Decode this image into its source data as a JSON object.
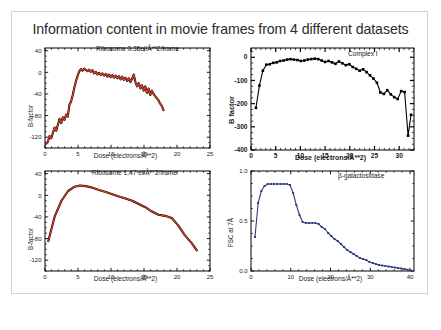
{
  "figure": {
    "title": "Information content in movie frames from 4 different datasets",
    "background": "#ffffff",
    "border_color": "#d3d3d3"
  },
  "chart_data": [
    {
      "id": "ribosome-low-dose",
      "type": "line",
      "title": "Ribosome 0.35el/Å**2/frame",
      "xlabel": "Dose (electrons/Å**2)",
      "ylabel": "B-factor",
      "xlim": [
        0,
        25
      ],
      "ylim": [
        -140,
        45
      ],
      "xticks": [
        0,
        5,
        10,
        15,
        20,
        25
      ],
      "yticks": [
        40,
        0,
        -40,
        -80,
        -120
      ],
      "grid": false,
      "legend": "none",
      "line_color": "#e8401f",
      "underlay_color": "#000000",
      "marker": "none",
      "x": [
        0.2,
        0.45,
        0.7,
        0.95,
        1.2,
        1.45,
        1.7,
        1.95,
        2.2,
        2.45,
        2.7,
        2.95,
        3.2,
        3.45,
        3.7,
        3.95,
        4.2,
        4.45,
        4.7,
        4.95,
        5.2,
        5.45,
        5.7,
        5.95,
        6.2,
        6.45,
        6.7,
        6.95,
        7.2,
        7.45,
        7.7,
        7.95,
        8.2,
        8.45,
        8.7,
        8.95,
        9.2,
        9.45,
        9.7,
        9.95,
        10.2,
        10.45,
        10.7,
        10.95,
        11.2,
        11.45,
        11.7,
        11.95,
        12.2,
        12.45,
        12.7,
        12.95,
        13.2,
        13.45,
        13.7,
        13.95,
        14.2,
        14.45,
        14.7,
        14.95,
        15.2,
        15.45,
        15.7,
        15.95,
        16.2,
        16.45,
        16.7,
        16.95,
        17.2,
        17.45,
        17.7,
        17.95
      ],
      "y": [
        -132,
        -128,
        -118,
        -122,
        -112,
        -102,
        -108,
        -97,
        -86,
        -94,
        -83,
        -88,
        -78,
        -82,
        -60,
        -54,
        -42,
        -28,
        -16,
        -6,
        2,
        6,
        3,
        7,
        4,
        2,
        5,
        1,
        4,
        -2,
        1,
        -4,
        -1,
        -5,
        -2,
        -6,
        -3,
        -8,
        -4,
        -9,
        -5,
        -10,
        -6,
        -11,
        -7,
        -13,
        -8,
        -14,
        -10,
        -16,
        -11,
        -18,
        -12,
        -4,
        -18,
        -26,
        -20,
        -30,
        -24,
        -34,
        -26,
        -38,
        -30,
        -42,
        -34,
        -40,
        -44,
        -48,
        -52,
        -58,
        -62,
        -70
      ]
    },
    {
      "id": "complex-i",
      "type": "line",
      "title": "Complex I",
      "xlabel": "Dose (electrons/Å**2)",
      "ylabel": "B factor",
      "xlim": [
        0,
        33
      ],
      "ylim": [
        -400,
        40
      ],
      "xticks": [
        0,
        5,
        10,
        15,
        20,
        25,
        30
      ],
      "yticks": [
        0,
        -100,
        -200,
        -300,
        -400
      ],
      "grid": false,
      "legend": "none",
      "line_color": "#000000",
      "marker": "square",
      "x": [
        1,
        1.7,
        2.4,
        3.1,
        3.8,
        4.5,
        5.2,
        5.9,
        6.6,
        7.3,
        8,
        8.7,
        9.4,
        10.1,
        10.8,
        11.5,
        12.2,
        12.9,
        13.6,
        14.3,
        15,
        15.7,
        16.4,
        17.1,
        17.8,
        18.5,
        19.2,
        19.9,
        20.6,
        21.3,
        22,
        22.7,
        23.4,
        24.1,
        24.8,
        25.5,
        26.2,
        26.9,
        27.6,
        28.3,
        29,
        29.7,
        30.4,
        31.1,
        31.8,
        32.4
      ],
      "y": [
        -218,
        -122,
        -58,
        -32,
        -30,
        -24,
        -22,
        -16,
        -14,
        -10,
        -8,
        -10,
        -12,
        -16,
        -14,
        -10,
        -8,
        -6,
        -8,
        -14,
        -20,
        -16,
        -22,
        -28,
        -18,
        -26,
        -34,
        -30,
        -42,
        -50,
        -58,
        -52,
        -64,
        -78,
        -92,
        -110,
        -152,
        -158,
        -142,
        -160,
        -172,
        -180,
        -146,
        -150,
        -338,
        -248
      ]
    },
    {
      "id": "ribosome-high-dose",
      "type": "line",
      "title": "Ribosome 1.47 el/Å**2/frame",
      "xlabel": "Dose (electrons/Å**2)",
      "ylabel": "B-factor",
      "xlim": [
        0,
        25
      ],
      "ylim": [
        -140,
        45
      ],
      "xticks": [
        0,
        5,
        10,
        15,
        20,
        25
      ],
      "yticks": [
        40,
        0,
        -40,
        -80,
        -120
      ],
      "grid": false,
      "legend": "none",
      "line_color": "#e8401f",
      "underlay_color": "#000000",
      "marker": "none",
      "x": [
        0.5,
        1.5,
        2.5,
        3.5,
        4.5,
        5.3,
        6.2,
        7.2,
        8.2,
        9.2,
        10.2,
        11.2,
        12.2,
        13.2,
        14.2,
        15.2,
        16.2,
        17.2,
        18.2,
        19.2,
        20.2,
        21.2,
        22.2,
        23.0
      ],
      "y": [
        -85,
        -38,
        -10,
        8,
        16,
        18,
        17,
        14,
        10,
        6,
        2,
        -2,
        -6,
        -10,
        -16,
        -22,
        -30,
        -36,
        -38,
        -42,
        -56,
        -74,
        -88,
        -102
      ]
    },
    {
      "id": "beta-galactosidase",
      "type": "line",
      "title": "β-galactosidase",
      "xlabel": "Dose (electrons/Å**2)",
      "ylabel": "FSC at 7Å",
      "xlim": [
        0,
        41
      ],
      "ylim": [
        0.0,
        1.0
      ],
      "xticks": [
        0,
        10,
        20,
        30,
        40
      ],
      "yticks": [
        1.0,
        0.5,
        0.0
      ],
      "grid": false,
      "legend": "none",
      "line_color": "#2f3d82",
      "marker": "square",
      "x": [
        1,
        1.8,
        2.6,
        3.4,
        4.2,
        5,
        5.8,
        6.6,
        7.4,
        8.2,
        9,
        9.8,
        10.6,
        11.4,
        12.2,
        13,
        13.8,
        14.6,
        15.4,
        16.2,
        17,
        17.8,
        18.6,
        19.4,
        20.2,
        21,
        21.8,
        22.6,
        23.4,
        24.2,
        25,
        25.8,
        26.6,
        27.4,
        28.2,
        29,
        29.8,
        30.6,
        31.4,
        32.2,
        33,
        33.8,
        34.6,
        35.4,
        36.2,
        37,
        37.8,
        38.6,
        39.4,
        40.2
      ],
      "y": [
        0.34,
        0.68,
        0.8,
        0.85,
        0.87,
        0.87,
        0.87,
        0.87,
        0.87,
        0.87,
        0.87,
        0.86,
        0.78,
        0.66,
        0.56,
        0.49,
        0.48,
        0.48,
        0.48,
        0.48,
        0.47,
        0.44,
        0.42,
        0.38,
        0.35,
        0.32,
        0.3,
        0.27,
        0.24,
        0.21,
        0.19,
        0.17,
        0.15,
        0.13,
        0.12,
        0.11,
        0.09,
        0.08,
        0.07,
        0.06,
        0.055,
        0.05,
        0.045,
        0.04,
        0.035,
        0.03,
        0.025,
        0.02,
        0.012,
        0.005
      ]
    }
  ]
}
